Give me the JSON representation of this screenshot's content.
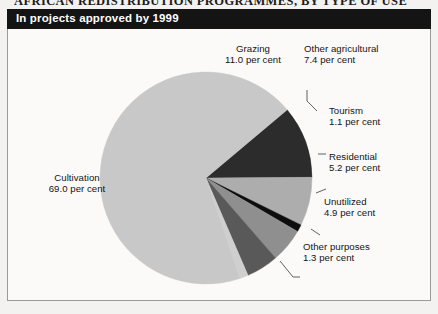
{
  "kicker": "AFRICAN REDISTRIBUTION PROGRAMMES, BY TYPE OF USE",
  "title": "In projects approved by 1999",
  "chart_data": {
    "type": "pie",
    "title": "In projects approved by 1999",
    "unit": "per cent",
    "value_suffix": " per cent",
    "total": 99.9,
    "legend_position": "callout-labels",
    "start_angle_deg": -40,
    "direction": "clockwise",
    "categories": [
      "Grazing",
      "Other agricultural",
      "Tourism",
      "Residential",
      "Unutilized",
      "Other purposes",
      "Cultivation"
    ],
    "values": [
      11.0,
      7.4,
      1.1,
      5.2,
      4.9,
      1.3,
      69.0
    ],
    "value_labels": [
      "11.0 per cent",
      "7.4 per cent",
      "1.1 per cent",
      "5.2 per cent",
      "4.9 per cent",
      "1.3 per cent",
      "69.0 per cent"
    ],
    "colors": [
      "#2c2c2c",
      "#adadad",
      "#0d0d0d",
      "#8f8f8f",
      "#595959",
      "#cfcfcf",
      "#c8c8c8"
    ],
    "slices": [
      {
        "name": "Grazing",
        "value": 11.0,
        "value_label": "11.0 per cent",
        "color": "#2c2c2c"
      },
      {
        "name": "Other agricultural",
        "value": 7.4,
        "value_label": "7.4 per cent",
        "color": "#adadad"
      },
      {
        "name": "Tourism",
        "value": 1.1,
        "value_label": "1.1 per cent",
        "color": "#0d0d0d"
      },
      {
        "name": "Residential",
        "value": 5.2,
        "value_label": "5.2 per cent",
        "color": "#8f8f8f"
      },
      {
        "name": "Unutilized",
        "value": 4.9,
        "value_label": "4.9 per cent",
        "color": "#595959"
      },
      {
        "name": "Other purposes",
        "value": 1.3,
        "value_label": "1.3 per cent",
        "color": "#cfcfcf"
      },
      {
        "name": "Cultivation",
        "value": 69.0,
        "value_label": "69.0 per cent",
        "color": "#c8c8c8"
      }
    ]
  },
  "labels": {
    "grazing": {
      "name": "Grazing",
      "value": "11.0 per cent"
    },
    "other_agri": {
      "name": "Other agricultural",
      "value": "7.4 per cent"
    },
    "tourism": {
      "name": "Tourism",
      "value": "1.1 per cent"
    },
    "residential": {
      "name": "Residential",
      "value": "5.2 per cent"
    },
    "unutilized": {
      "name": "Unutilized",
      "value": "4.9 per cent"
    },
    "other_purp": {
      "name": "Other purposes",
      "value": "1.3 per cent"
    },
    "cultivation": {
      "name": "Cultivation",
      "value": "69.0 per cent"
    }
  }
}
